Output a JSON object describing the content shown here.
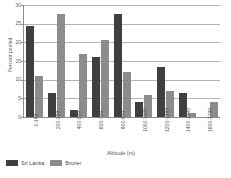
{
  "chart_data": {
    "type": "bar",
    "title": "",
    "xlabel": "Altitude (m)",
    "ylabel": "Percent pooled",
    "ylim": [
      0,
      30
    ],
    "yticks": [
      30,
      25,
      20,
      15,
      10,
      5,
      0
    ],
    "grid": true,
    "legend_position": "bottom-left",
    "categories": [
      "0-199",
      "200-399",
      "400-599",
      "600-799",
      "800-999",
      "1000-1199",
      "1200-1399",
      "1400-1599",
      "1600-1799"
    ],
    "series": [
      {
        "name": "Sri Lanka",
        "color": "#3f3f3f",
        "values": [
          24.5,
          6.5,
          2.0,
          16.0,
          27.5,
          4.0,
          13.5,
          6.5,
          0
        ]
      },
      {
        "name": "Brunei",
        "color": "#8c8c8c",
        "values": [
          11.0,
          27.5,
          17.0,
          20.5,
          12.0,
          6.0,
          7.0,
          1.0,
          4.0
        ]
      }
    ]
  },
  "axis": {
    "y_title": "Percent pooled",
    "x_title": "Altitude (m)",
    "y_tick_labels": [
      "30",
      "25",
      "20",
      "15",
      "10",
      "5",
      "0"
    ]
  },
  "legend": {
    "items": [
      {
        "label": "Sri Lanka",
        "color": "#3f3f3f"
      },
      {
        "label": "Brunei",
        "color": "#8c8c8c"
      }
    ]
  }
}
